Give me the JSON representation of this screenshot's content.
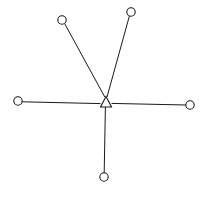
{
  "diagram": {
    "type": "node-link-graph",
    "canvas": {
      "width": 207,
      "height": 198,
      "background": "#ffffff"
    },
    "style": {
      "line_color": "#1a1a1a",
      "line_width": 1,
      "node_fill": "#ffffff",
      "node_stroke": "#1a1a1a",
      "node_stroke_width": 1.1
    },
    "hub": {
      "id": "hub",
      "label": "",
      "shape": "triangle",
      "x": 106,
      "y": 103,
      "apex": {
        "x": 106,
        "y": 96.5
      },
      "base_left": {
        "x": 100.5,
        "y": 107
      },
      "base_right": {
        "x": 111.5,
        "y": 107
      },
      "points": "106,96.5 100.5,107 111.5,107"
    },
    "nodes": [
      {
        "id": "node-top-left",
        "label": "",
        "shape": "circle",
        "x": 62,
        "y": 20,
        "r": 4.2
      },
      {
        "id": "node-top-right",
        "label": "",
        "shape": "circle",
        "x": 131,
        "y": 12,
        "r": 4.2
      },
      {
        "id": "node-left",
        "label": "",
        "shape": "circle",
        "x": 18,
        "y": 101,
        "r": 4.2
      },
      {
        "id": "node-right",
        "label": "",
        "shape": "circle",
        "x": 190,
        "y": 105,
        "r": 4.2
      },
      {
        "id": "node-bottom",
        "label": "",
        "shape": "circle",
        "x": 104,
        "y": 177,
        "r": 4.2
      }
    ],
    "edges": [
      {
        "id": "edge-hub-top-left",
        "from": "hub",
        "to": "node-top-left",
        "x1": 104.8,
        "y1": 97.0,
        "x2": 64.6,
        "y2": 23.5
      },
      {
        "id": "edge-hub-top-right",
        "from": "hub",
        "to": "node-top-right",
        "x1": 107.0,
        "y1": 97.0,
        "x2": 129.4,
        "y2": 16.0
      },
      {
        "id": "edge-hub-left",
        "from": "hub",
        "to": "node-left",
        "x1": 100.5,
        "y1": 103.6,
        "x2": 22.2,
        "y2": 101.8
      },
      {
        "id": "edge-hub-right",
        "from": "hub",
        "to": "node-right",
        "x1": 111.5,
        "y1": 103.4,
        "x2": 185.8,
        "y2": 105.0
      },
      {
        "id": "edge-hub-bottom",
        "from": "hub",
        "to": "node-bottom",
        "x1": 105.4,
        "y1": 107.0,
        "x2": 104.2,
        "y2": 172.8
      }
    ]
  }
}
